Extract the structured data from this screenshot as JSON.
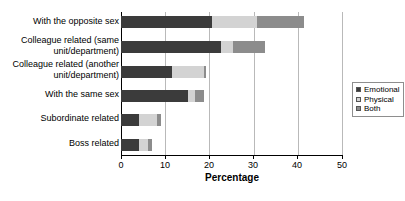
{
  "chart_data": {
    "type": "bar",
    "orientation": "horizontal",
    "stacked": true,
    "title": "",
    "xlabel": "Percentage",
    "ylabel": "",
    "xlim": [
      0,
      50
    ],
    "xticks": [
      0,
      10,
      20,
      30,
      40,
      50
    ],
    "grid": true,
    "legend_position": "right",
    "categories": [
      "With the opposite sex",
      "Colleague related (same unit/department)",
      "Colleague related (another unit/department)",
      "With the same sex",
      "Subordinate related",
      "Boss related"
    ],
    "series": [
      {
        "name": "Emotional",
        "color": "#3b3b3b",
        "values": [
          20.7,
          22.6,
          11.6,
          15.2,
          4.0,
          4.1
        ]
      },
      {
        "name": "Physical",
        "color": "#d3d3d3",
        "values": [
          10.1,
          2.8,
          7.2,
          1.6,
          4.2,
          2.0
        ]
      },
      {
        "name": "Both",
        "color": "#8c8c8c",
        "values": [
          10.5,
          7.1,
          0.5,
          2.0,
          0.9,
          0.9
        ]
      }
    ],
    "totals": [
      41.3,
      32.5,
      19.3,
      18.8,
      9.1,
      7.0
    ]
  },
  "axis": {
    "tick_labels": [
      "0",
      "10",
      "20",
      "30",
      "40",
      "50"
    ],
    "title": "Percentage"
  },
  "legend": {
    "entries": [
      {
        "label": "Emotional"
      },
      {
        "label": "Physical"
      },
      {
        "label": "Both"
      }
    ]
  },
  "categories": [
    {
      "line1": "With the opposite sex",
      "line2": ""
    },
    {
      "line1": "Colleague related (same",
      "line2": "unit/department)"
    },
    {
      "line1": "Colleague related (another",
      "line2": "unit/department)"
    },
    {
      "line1": "With the same sex",
      "line2": ""
    },
    {
      "line1": "Subordinate related",
      "line2": ""
    },
    {
      "line1": "Boss related",
      "line2": ""
    }
  ]
}
